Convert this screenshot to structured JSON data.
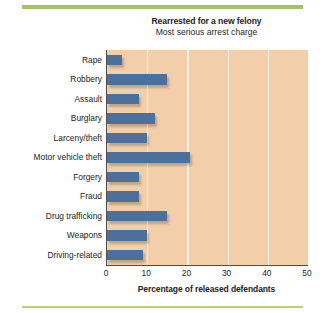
{
  "chart_data": {
    "type": "bar",
    "orientation": "horizontal",
    "title": "Rearrested for a new felony",
    "subtitle": "Most serious arrest charge",
    "xlabel": "Percentage of released defendants",
    "ylabel": "",
    "xlim": [
      0,
      50
    ],
    "xticks": [
      0,
      10,
      20,
      30,
      40,
      50
    ],
    "xtick_labels": [
      "0",
      "10",
      "20",
      "30",
      "40",
      "50"
    ],
    "grid": "vertical gridlines at 10, 20, 30, 40",
    "legend": "none",
    "categories": [
      "Rape",
      "Robbery",
      "Assault",
      "Burglary",
      "Larceny/theft",
      "Motor vehicle theft",
      "Forgery",
      "Fraud",
      "Drug trafficking",
      "Weapons",
      "Driving-related"
    ],
    "values": [
      3.7,
      15.0,
      8.0,
      12.0,
      10.0,
      20.6,
      8.0,
      8.0,
      15.0,
      10.0,
      9.0
    ],
    "bar_color": "#4c6f9c",
    "plot_background": "#f2cfa8",
    "gridline_color": "#fdf3e6",
    "accent_rule_color": "#a8c261"
  }
}
